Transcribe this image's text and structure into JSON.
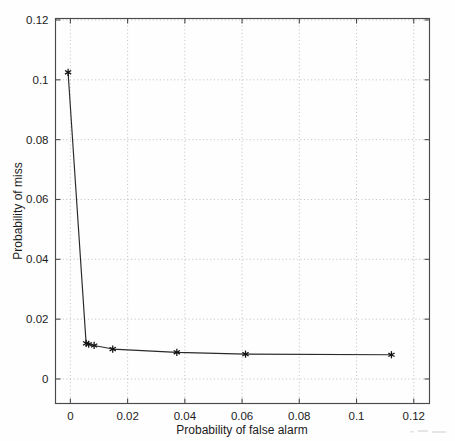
{
  "figure": {
    "background_color": "#fefefe",
    "axis_color": "#4a4a4a",
    "grid_color": "#b4b4b4",
    "line_color": "#2a2a2a",
    "marker_color": "#111111",
    "marker_style": "asterisk"
  },
  "chart_data": {
    "type": "line",
    "title": "",
    "subtitle": "",
    "xlabel": "Probability of false alarm",
    "ylabel": "Probability of miss",
    "xlim": [
      -0.0052,
      0.1255
    ],
    "ylim": [
      -0.0082,
      0.1205
    ],
    "xticks": [
      0,
      0.02,
      0.04,
      0.06,
      0.08,
      0.1,
      0.12
    ],
    "yticks": [
      0,
      0.02,
      0.04,
      0.06,
      0.08,
      0.1,
      0.12
    ],
    "xticklabels": [
      "0",
      "0.02",
      "0.04",
      "0.06",
      "0.08",
      "0.1",
      "0.12"
    ],
    "yticklabels": [
      "0",
      "0.02",
      "0.04",
      "0.06",
      "0.08",
      "0.1",
      "0.12"
    ],
    "grid": true,
    "grid_style": "dotted",
    "legend": null,
    "legend_position": "none",
    "series": [
      {
        "name": "Detection error tradeoff",
        "marker": "asterisk",
        "x": [
          -0.0008,
          0.0055,
          0.0064,
          0.0083,
          0.0148,
          0.0372,
          0.0612,
          0.1122
        ],
        "y": [
          0.1025,
          0.0119,
          0.0116,
          0.0112,
          0.01,
          0.0089,
          0.0083,
          0.0081
        ]
      }
    ],
    "annotations": []
  }
}
